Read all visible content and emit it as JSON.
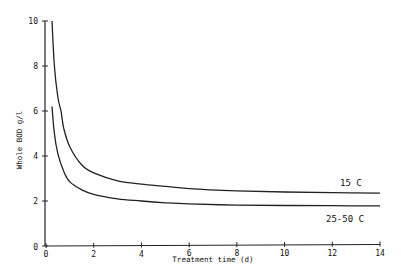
{
  "chart_data": {
    "type": "line",
    "title": "",
    "xlabel": "Treatment time (d)",
    "ylabel": "Whole BOD  g/l",
    "xlim": [
      0,
      14
    ],
    "ylim": [
      0,
      10
    ],
    "x_ticks": [
      0,
      2,
      4,
      6,
      8,
      10,
      12,
      14
    ],
    "y_ticks": [
      0,
      2,
      4,
      6,
      8,
      10
    ],
    "grid": false,
    "legend": "inline labels at right end of curves",
    "series": [
      {
        "name": "15 C",
        "x": [
          0.25,
          0.35,
          0.5,
          0.63,
          0.75,
          1,
          1.5,
          2,
          3,
          4,
          5,
          6,
          8,
          10,
          12,
          14
        ],
        "values": [
          10.0,
          8.0,
          6.6,
          6.0,
          5.2,
          4.4,
          3.6,
          3.25,
          2.9,
          2.75,
          2.65,
          2.55,
          2.45,
          2.4,
          2.37,
          2.35
        ]
      },
      {
        "name": "25-50 C",
        "x": [
          0.25,
          0.35,
          0.5,
          0.75,
          1,
          1.5,
          2,
          3,
          4,
          5,
          6,
          8,
          10,
          12,
          14
        ],
        "values": [
          6.2,
          5.0,
          4.1,
          3.3,
          2.85,
          2.5,
          2.3,
          2.1,
          2.0,
          1.92,
          1.87,
          1.82,
          1.8,
          1.79,
          1.78
        ]
      }
    ]
  },
  "labels": {
    "xlabel": "Treatment time (d)",
    "ylabel": "Whole BOD  g/l",
    "series_1": "15 C",
    "series_2": "25-50 C"
  }
}
